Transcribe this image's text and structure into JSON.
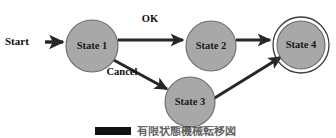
{
  "figure": {
    "type": "state-transition-diagram",
    "background_color": "#ffffff",
    "node_fill_color": "#a8a8a8",
    "node_stroke_color": "#6b6b6b",
    "edge_color": "#262626",
    "text_color": "#0f0f0f"
  },
  "start_marker": {
    "label": "Start"
  },
  "nodes": [
    {
      "id": "state1",
      "label": "State 1",
      "kind": "normal",
      "cx": 92,
      "cy": 46,
      "r": 26
    },
    {
      "id": "state2",
      "label": "State 2",
      "kind": "normal",
      "cx": 211,
      "cy": 46,
      "r": 25
    },
    {
      "id": "state3",
      "label": "State 3",
      "kind": "normal",
      "cx": 190,
      "cy": 102,
      "r": 25
    },
    {
      "id": "state4",
      "label": "State 4",
      "kind": "final",
      "cx": 301,
      "cy": 45,
      "r": 24,
      "ring_r": 28
    }
  ],
  "edges": [
    {
      "id": "start-to-state1",
      "from": "start",
      "to": "state1",
      "label": ""
    },
    {
      "id": "state1-to-state2",
      "from": "state1",
      "to": "state2",
      "label": "OK"
    },
    {
      "id": "state2-to-state4",
      "from": "state2",
      "to": "state4",
      "label": ""
    },
    {
      "id": "state1-to-state3",
      "from": "state1",
      "to": "state3",
      "label": "Cancel"
    },
    {
      "id": "state3-to-state4",
      "from": "state3",
      "to": "state4",
      "label": ""
    }
  ],
  "edge_labels": {
    "ok": "OK",
    "cancel": "Cancel"
  },
  "caption": {
    "badge": "",
    "text": "有限状態機械転移図"
  }
}
